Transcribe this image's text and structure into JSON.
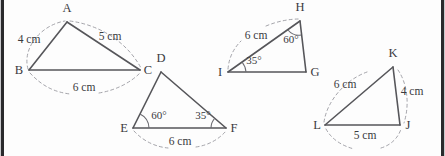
{
  "figure": {
    "stroke_color": "#56565a",
    "arc_color": "#9a9aa0",
    "background": "#fdfdfd",
    "border_color": "#2a2a2c"
  },
  "triangles": [
    {
      "id": "abc",
      "vertices": [
        {
          "label": "A",
          "x": 67,
          "y": 22,
          "label_x": 67,
          "label_y": 12
        },
        {
          "label": "B",
          "x": 29,
          "y": 70,
          "label_x": 19,
          "label_y": 74
        },
        {
          "label": "C",
          "x": 140,
          "y": 70,
          "label_x": 148,
          "label_y": 74
        }
      ],
      "measures": [
        {
          "label": "4 cm",
          "x": 29,
          "y": 43
        },
        {
          "label": "5 cm",
          "x": 110,
          "y": 40
        },
        {
          "label": "6 cm",
          "x": 84,
          "y": 91
        }
      ]
    },
    {
      "id": "def",
      "vertices": [
        {
          "label": "D",
          "x": 161,
          "y": 72,
          "label_x": 161,
          "label_y": 62
        },
        {
          "label": "E",
          "x": 133,
          "y": 128,
          "label_x": 124,
          "label_y": 132
        },
        {
          "label": "F",
          "x": 226,
          "y": 128,
          "label_x": 234,
          "label_y": 132
        }
      ],
      "measures": [
        {
          "label": "6 cm",
          "x": 180,
          "y": 145
        }
      ],
      "angles": [
        {
          "label": "60°",
          "x": 159,
          "y": 119
        },
        {
          "label": "35°",
          "x": 203,
          "y": 119
        }
      ]
    },
    {
      "id": "ghi",
      "vertices": [
        {
          "label": "H",
          "x": 300,
          "y": 21,
          "label_x": 300,
          "label_y": 11
        },
        {
          "label": "I",
          "x": 228,
          "y": 72,
          "label_x": 220,
          "label_y": 76
        },
        {
          "label": "G",
          "x": 306,
          "y": 72,
          "label_x": 315,
          "label_y": 76
        }
      ],
      "measures": [
        {
          "label": "6 cm",
          "x": 256,
          "y": 39
        }
      ],
      "angles": [
        {
          "label": "60°",
          "x": 291,
          "y": 43
        },
        {
          "label": "35°",
          "x": 254,
          "y": 64
        }
      ]
    },
    {
      "id": "jkl",
      "vertices": [
        {
          "label": "K",
          "x": 393,
          "y": 67,
          "label_x": 393,
          "label_y": 57
        },
        {
          "label": "L",
          "x": 325,
          "y": 125,
          "label_x": 317,
          "label_y": 129
        },
        {
          "label": "J",
          "x": 400,
          "y": 125,
          "label_x": 408,
          "label_y": 129
        }
      ],
      "measures": [
        {
          "label": "6 cm",
          "x": 345,
          "y": 88
        },
        {
          "label": "4 cm",
          "x": 412,
          "y": 95
        },
        {
          "label": "5 cm",
          "x": 365,
          "y": 139
        }
      ]
    }
  ]
}
